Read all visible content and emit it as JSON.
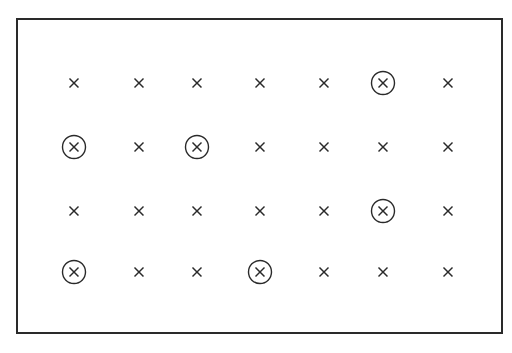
{
  "diagram": {
    "type": "grid-of-marks",
    "rows": 4,
    "cols": 7,
    "mark_glyph": "×",
    "mark_color": "#2a2a2a",
    "frame_color": "#2a2a2a",
    "col_x": [
      74,
      139,
      197,
      260,
      324,
      383,
      448
    ],
    "row_y": [
      83,
      147,
      211,
      272
    ],
    "grid": [
      [
        0,
        0,
        0,
        0,
        0,
        1,
        0
      ],
      [
        1,
        0,
        1,
        0,
        0,
        0,
        0
      ],
      [
        0,
        0,
        0,
        0,
        0,
        1,
        0
      ],
      [
        1,
        0,
        0,
        1,
        0,
        0,
        0
      ]
    ],
    "legend": {
      "0": "cross",
      "1": "circled-cross"
    }
  }
}
